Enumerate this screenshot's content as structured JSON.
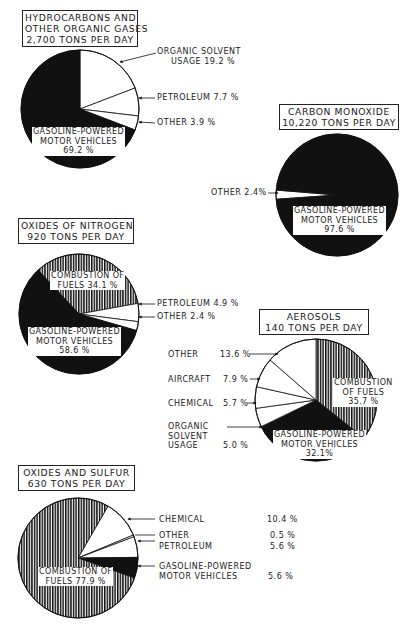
{
  "chart_data": [
    {
      "type": "pie",
      "id": "hydrocarbons",
      "title": "HYDROCARBONS AND OTHER ORGANIC GASES 2,700 TONS PER DAY",
      "title_lines": [
        "HYDROCARBONS AND",
        "OTHER ORGANIC GASES",
        "2,700 TONS PER DAY"
      ],
      "total_tons_per_day": 2700,
      "start_angle_deg": 0,
      "slices": [
        {
          "label": "ORGANIC SOLVENT USAGE",
          "value": 19.2,
          "fill": "white"
        },
        {
          "label": "PETROLEUM",
          "value": 7.7,
          "fill": "white"
        },
        {
          "label": "OTHER",
          "value": 3.9,
          "fill": "white"
        },
        {
          "label": "GASOLINE-POWERED MOTOR VEHICLES",
          "value": 69.2,
          "fill": "black"
        }
      ]
    },
    {
      "type": "pie",
      "id": "carbon-monoxide",
      "title": "CARBON MONOXIDE 10,220 TONS PER DAY",
      "title_lines": [
        "CARBON MONOXIDE",
        "10,220 TONS PER DAY"
      ],
      "total_tons_per_day": 10220,
      "start_angle_deg": 266,
      "slices": [
        {
          "label": "OTHER",
          "value": 2.4,
          "fill": "white"
        },
        {
          "label": "GASOLINE-POWERED MOTOR VEHICLES",
          "value": 97.6,
          "fill": "black"
        }
      ]
    },
    {
      "type": "pie",
      "id": "oxides-of-nitrogen",
      "title": "OXIDES OF NITROGEN 920 TONS PER DAY",
      "title_lines": [
        "OXIDES OF NITROGEN",
        "920 TONS PER DAY"
      ],
      "total_tons_per_day": 920,
      "start_angle_deg": 317,
      "slices": [
        {
          "label": "COMBUSTION OF FUELS",
          "value": 34.1,
          "fill": "hatch"
        },
        {
          "label": "PETROLEUM",
          "value": 4.9,
          "fill": "white"
        },
        {
          "label": "OTHER",
          "value": 2.4,
          "fill": "white"
        },
        {
          "label": "GASOLINE-POWERED MOTOR VEHICLES",
          "value": 58.6,
          "fill": "black"
        }
      ]
    },
    {
      "type": "pie",
      "id": "aerosols",
      "title": "AEROSOLS 140 TONS PER DAY",
      "title_lines": [
        "AEROSOLS",
        "140 TONS PER DAY"
      ],
      "total_tons_per_day": 140,
      "start_angle_deg": 0,
      "slices": [
        {
          "label": "COMBUSTION OF FUELS",
          "value": 35.7,
          "fill": "hatch"
        },
        {
          "label": "GASOLINE-POWERED MOTOR VEHICLES",
          "value": 32.1,
          "fill": "black"
        },
        {
          "label": "ORGANIC SOLVENT USAGE",
          "value": 5.0,
          "fill": "white"
        },
        {
          "label": "CHEMICAL",
          "value": 5.7,
          "fill": "white"
        },
        {
          "label": "AIRCRAFT",
          "value": 7.9,
          "fill": "white"
        },
        {
          "label": "OTHER",
          "value": 13.6,
          "fill": "white"
        }
      ]
    },
    {
      "type": "pie",
      "id": "oxides-of-sulfur",
      "title": "OXIDES AND SULFUR 630 TONS PER DAY",
      "title_lines": [
        "OXIDES AND SULFUR",
        "630 TONS PER DAY"
      ],
      "total_tons_per_day": 630,
      "start_angle_deg": 30,
      "slices": [
        {
          "label": "CHEMICAL",
          "value": 10.4,
          "fill": "white"
        },
        {
          "label": "OTHER",
          "value": 0.5,
          "fill": "white"
        },
        {
          "label": "PETROLEUM",
          "value": 5.6,
          "fill": "white"
        },
        {
          "label": "GASOLINE-POWERED MOTOR VEHICLES",
          "value": 5.6,
          "fill": "black"
        },
        {
          "label": "COMBUSTION OF FUELS",
          "value": 77.9,
          "fill": "hatch"
        }
      ]
    }
  ],
  "colors": {
    "ink": "#111111",
    "paper": "#ffffff"
  },
  "text": {
    "hc": {
      "t1": "HYDROCARBONS AND",
      "t2": "OTHER ORGANIC GASES",
      "t3": "2,700 TONS PER DAY",
      "solvent1": "ORGANIC SOLVENT",
      "solvent2": "USAGE 19.2 %",
      "petroleum": "PETROLEUM 7.7 %",
      "other": "OTHER  3.9 %",
      "gas1": "GASOLINE-POWERED",
      "gas2": "MOTOR VEHICLES",
      "gas3": "69.2 %"
    },
    "co": {
      "t1": "CARBON  MONOXIDE",
      "t2": "10,220 TONS  PER DAY",
      "other": "OTHER 2.4%",
      "gas1": "GASOLINE-POWERED",
      "gas2": "MOTOR VEHICLES",
      "gas3": "97.6 %"
    },
    "nox": {
      "t1": "OXIDES  OF  NITROGEN",
      "t2": "920 TONS PER DAY",
      "comb1": "COMBUSTION OF",
      "comb2": "FUELS 34.1 %",
      "petroleum": "PETROLEUM 4.9 %",
      "other": "OTHER 2.4 %",
      "gas1": "GASOLINE-POWERED",
      "gas2": "MOTOR VEHICLES",
      "gas3": "58.6 %"
    },
    "aer": {
      "t1": "AEROSOLS",
      "t2": "140 TONS PER DAY",
      "other": "OTHER",
      "other_v": "13.6 %",
      "aircraft": "AIRCRAFT",
      "aircraft_v": "7.9 %",
      "chemical": "CHEMICAL",
      "chemical_v": "5.7 %",
      "solvent1": "ORGANIC",
      "solvent2": "SOLVENT",
      "solvent3": "USAGE",
      "solvent_v": "5.0 %",
      "comb1": "COMBUSTION",
      "comb2": "OF FUELS",
      "comb3": "35.7 %",
      "gas1": "GASOLINE-POWERED",
      "gas2": "MOTOR VEHICLES",
      "gas3": "32.1%"
    },
    "sox": {
      "t1": "OXIDES  AND  SULFUR",
      "t2": "630 TONS PER DAY",
      "chemical": "CHEMICAL",
      "chemical_v": "10.4 %",
      "other": "OTHER",
      "other_v": "0.5 %",
      "petroleum": "PETROLEUM",
      "petroleum_v": "5.6 %",
      "gas1": "GASOLINE-POWERED",
      "gas2": "MOTOR VEHICLES",
      "gas_v": "5.6 %",
      "comb1": "COMBUSTION OF",
      "comb2": "FUELS 77.9 %"
    }
  }
}
